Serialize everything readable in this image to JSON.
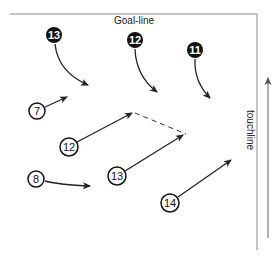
{
  "labels": {
    "goal_line": "Goal-line",
    "touchline": "touchline"
  },
  "colors": {
    "line": "#222222",
    "boundary": "#888888",
    "attacker_fill": "#111111",
    "defender_fill": "#ffffff"
  },
  "attackers": [
    {
      "number": "13",
      "style": "filled"
    },
    {
      "number": "12",
      "style": "filled"
    },
    {
      "number": "11",
      "style": "filled"
    }
  ],
  "defenders": [
    {
      "number": "7",
      "style": "outlined"
    },
    {
      "number": "12",
      "style": "outlined"
    },
    {
      "number": "8",
      "style": "outlined"
    },
    {
      "number": "13",
      "style": "outlined"
    },
    {
      "number": "14",
      "style": "outlined"
    }
  ],
  "connections": [
    {
      "from": "defender-12-arrow-end",
      "to": "defender-13-arrow-end",
      "style": "dashed"
    }
  ],
  "direction_arrow": {
    "label": "touchline",
    "direction": "up"
  }
}
